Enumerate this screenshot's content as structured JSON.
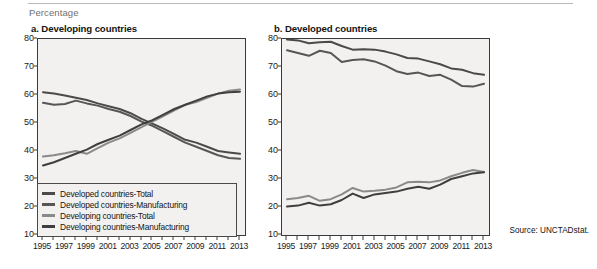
{
  "unit_label": "Percentage",
  "source_note": "Source: UNCTADstat.",
  "colors": {
    "developed_total": "#4a4a4a",
    "developed_manufacturing": "#565656",
    "developing_total": "#8a8a8a",
    "developing_manufacturing": "#3f3f3f",
    "plot_background": "#f2f1ef",
    "axis": "#3a3a3a"
  },
  "legend": {
    "items": [
      {
        "label": "Developed countries-Total",
        "color": "#4a4a4a"
      },
      {
        "label": "Developed countries-Manufacturing",
        "color": "#565656"
      },
      {
        "label": "Developing countries-Total",
        "color": "#8a8a8a"
      },
      {
        "label": "Developing countries-Manufacturing",
        "color": "#3f3f3f"
      }
    ]
  },
  "chart_data": [
    {
      "type": "line",
      "title": "a. Developing countries",
      "xlabel": "",
      "ylabel": "Percentage",
      "ylim": [
        10,
        80
      ],
      "yticks": [
        10,
        20,
        30,
        40,
        50,
        60,
        70,
        80
      ],
      "grid": false,
      "legend_position": "inside-bottom-left",
      "x": [
        1995,
        1996,
        1997,
        1998,
        1999,
        2000,
        2001,
        2002,
        2003,
        2004,
        2005,
        2006,
        2007,
        2008,
        2009,
        2010,
        2011,
        2012,
        2013
      ],
      "xticklabels": [
        "1995",
        "1997",
        "1999",
        "2001",
        "2003",
        "2005",
        "2007",
        "2009",
        "2011",
        "2013"
      ],
      "series": [
        {
          "name": "Developed countries-Total",
          "color": "#4a4a4a",
          "values": [
            61.0,
            60.5,
            59.8,
            59.0,
            58.2,
            57.0,
            56.0,
            55.0,
            53.5,
            51.5,
            49.8,
            48.0,
            46.0,
            44.0,
            43.0,
            41.5,
            40.0,
            39.5,
            39.0
          ]
        },
        {
          "name": "Developed countries-Manufacturing",
          "color": "#565656",
          "values": [
            57.2,
            56.5,
            56.8,
            58.0,
            57.0,
            56.2,
            55.0,
            54.0,
            52.5,
            50.5,
            49.0,
            47.0,
            45.0,
            43.0,
            41.5,
            40.0,
            38.5,
            37.5,
            37.2
          ]
        },
        {
          "name": "Developing countries-Total",
          "color": "#8a8a8a",
          "values": [
            38.0,
            38.5,
            39.2,
            40.0,
            39.0,
            41.0,
            43.0,
            44.5,
            46.5,
            48.5,
            50.5,
            52.5,
            54.5,
            56.5,
            57.5,
            59.0,
            60.5,
            61.5,
            62.0
          ]
        },
        {
          "name": "Developing countries-Manufacturing",
          "color": "#3f3f3f",
          "values": [
            34.8,
            36.0,
            37.5,
            39.0,
            40.5,
            42.5,
            44.0,
            45.5,
            47.5,
            49.5,
            51.0,
            53.0,
            55.0,
            56.5,
            58.0,
            59.5,
            60.5,
            61.0,
            61.2
          ]
        }
      ]
    },
    {
      "type": "line",
      "title": "b. Developed countries",
      "xlabel": "",
      "ylabel": "Percentage",
      "ylim": [
        10,
        80
      ],
      "yticks": [
        10,
        20,
        30,
        40,
        50,
        60,
        70,
        80
      ],
      "grid": false,
      "legend_position": "none",
      "x": [
        1995,
        1996,
        1997,
        1998,
        1999,
        2000,
        2001,
        2002,
        2003,
        2004,
        2005,
        2006,
        2007,
        2008,
        2009,
        2010,
        2011,
        2012,
        2013
      ],
      "xticklabels": [
        "1995",
        "1997",
        "1999",
        "2001",
        "2003",
        "2005",
        "2007",
        "2009",
        "2011",
        "2013"
      ],
      "series": [
        {
          "name": "Developed countries-Total",
          "color": "#4a4a4a",
          "values": [
            79.8,
            79.5,
            78.5,
            78.8,
            79.0,
            77.5,
            76.2,
            76.3,
            76.2,
            75.5,
            74.5,
            73.2,
            73.0,
            72.0,
            71.0,
            69.5,
            69.0,
            67.8,
            67.2
          ]
        },
        {
          "name": "Developed countries-Manufacturing",
          "color": "#565656",
          "values": [
            76.0,
            75.0,
            74.0,
            75.8,
            75.0,
            71.8,
            72.5,
            72.8,
            72.0,
            70.5,
            68.5,
            67.5,
            68.0,
            66.8,
            67.2,
            65.5,
            63.2,
            63.0,
            64.0
          ]
        },
        {
          "name": "Developing countries-Total",
          "color": "#8a8a8a",
          "values": [
            22.8,
            23.2,
            24.0,
            22.2,
            22.8,
            24.5,
            26.8,
            25.5,
            25.8,
            26.2,
            27.0,
            28.8,
            29.0,
            28.8,
            29.5,
            31.0,
            32.2,
            33.2,
            32.5
          ]
        },
        {
          "name": "Developing countries-Manufacturing",
          "color": "#3f3f3f",
          "values": [
            20.2,
            20.5,
            21.5,
            20.5,
            21.0,
            22.5,
            24.8,
            23.2,
            24.5,
            25.0,
            25.5,
            26.5,
            27.2,
            26.5,
            28.0,
            30.0,
            31.0,
            32.0,
            32.4
          ]
        }
      ]
    }
  ]
}
